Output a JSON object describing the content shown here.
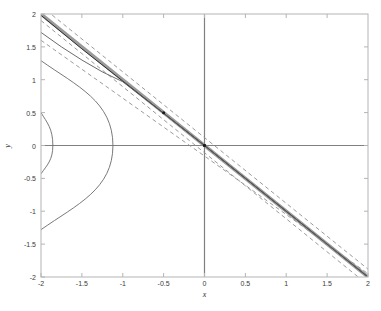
{
  "figure": {
    "background_color": "#ffffff",
    "width": 381,
    "height": 311
  },
  "chart_data": {
    "type": "line",
    "title": "",
    "subtitle": "",
    "xlabel": "x",
    "ylabel": "y",
    "xlim": [
      -2,
      2
    ],
    "ylim": [
      -2,
      2
    ],
    "grid": false,
    "legend": null,
    "legend_position": "none",
    "box": true,
    "tick_direction": "in",
    "xticks": [
      -2,
      -1.5,
      -1,
      -0.5,
      0,
      0.5,
      1,
      1.5,
      2
    ],
    "xtick_labels": [
      "-2",
      "-1.5",
      "-1",
      "-0.5",
      "0",
      "0.5",
      "1",
      "1.5",
      "2"
    ],
    "yticks": [
      -2,
      -1.5,
      -1,
      -0.5,
      0,
      0.5,
      1,
      1.5,
      2
    ],
    "ytick_labels": [
      "-2",
      "-1.5",
      "-1",
      "-0.5",
      "0",
      "0.5",
      "1",
      "1.5",
      "2"
    ],
    "reference_lines": [
      {
        "name": "x-axis-zero-line",
        "orientation": "horizontal",
        "value": 0,
        "color": "#808080",
        "style": "solid",
        "width": 1.2
      },
      {
        "name": "y-axis-zero-line",
        "orientation": "vertical",
        "value": 0,
        "color": "#808080",
        "style": "solid",
        "width": 1.2
      }
    ],
    "series": [
      {
        "name": "thick-gray-band",
        "label": "",
        "type": "line",
        "style": "solid",
        "color": "#9a9a9a",
        "width": 3.4,
        "points": [
          [
            -2,
            2
          ],
          [
            2,
            -2
          ]
        ]
      },
      {
        "name": "dark-center-line",
        "label": "",
        "type": "line",
        "style": "solid",
        "color": "#303030",
        "width": 1.0,
        "points": [
          [
            -2,
            1.98
          ],
          [
            -1.5,
            1.47
          ],
          [
            -1.0,
            0.98
          ],
          [
            -0.5,
            0.49
          ],
          [
            0,
            0.0
          ],
          [
            0.5,
            -0.5
          ],
          [
            1.0,
            -1.0
          ],
          [
            1.5,
            -1.5
          ],
          [
            2,
            -2.0
          ]
        ]
      },
      {
        "name": "dashed-upper-bound",
        "label": "",
        "type": "line",
        "style": "dashed",
        "color": "#8e8e8e",
        "width": 0.9,
        "points": [
          [
            -2,
            1.9
          ],
          [
            2,
            -2.12
          ]
        ]
      },
      {
        "name": "dashed-lower-bound",
        "label": "",
        "type": "line",
        "style": "dashed",
        "color": "#8e8e8e",
        "width": 0.9,
        "points": [
          [
            -2,
            2.12
          ],
          [
            2,
            -1.88
          ]
        ]
      },
      {
        "name": "dashed-inner-bound",
        "label": "",
        "type": "line",
        "style": "dashed",
        "color": "#8e8e8e",
        "width": 0.9,
        "points": [
          [
            -2,
            1.6
          ],
          [
            -1.0,
            0.72
          ],
          [
            0,
            -0.16
          ],
          [
            1.0,
            -1.05
          ],
          [
            2,
            -1.95
          ]
        ]
      },
      {
        "name": "thin-solid-curve",
        "label": "",
        "type": "line",
        "style": "solid",
        "color": "#5a5a5a",
        "width": 0.9,
        "points": [
          [
            -2,
            1.72
          ],
          [
            -1.75,
            1.5
          ],
          [
            -1.5,
            1.3
          ],
          [
            -1.25,
            1.12
          ],
          [
            -1.0,
            0.97
          ],
          [
            -0.75,
            0.73
          ],
          [
            -0.5,
            0.49
          ],
          [
            0,
            0.0
          ],
          [
            0.5,
            -0.5
          ],
          [
            1.0,
            -1.0
          ],
          [
            1.5,
            -1.5
          ],
          [
            2,
            -2.0
          ]
        ]
      },
      {
        "name": "outer-left-opening-arc",
        "label": "",
        "type": "line",
        "style": "solid",
        "color": "#6a6a6a",
        "width": 0.9,
        "description": "left-opening conic, vertex near (-1.12, 0), exits left edge at y = +/-1.29",
        "vertex": [
          -1.12,
          0
        ],
        "edge_crossings": [
          [
            -2,
            1.29
          ],
          [
            -2,
            -1.28
          ]
        ],
        "points": [
          [
            -2,
            1.29
          ],
          [
            -1.85,
            1.17
          ],
          [
            -1.7,
            1.05
          ],
          [
            -1.55,
            0.93
          ],
          [
            -1.4,
            0.79
          ],
          [
            -1.3,
            0.67
          ],
          [
            -1.2,
            0.5
          ],
          [
            -1.14,
            0.3
          ],
          [
            -1.12,
            0
          ],
          [
            -1.14,
            -0.3
          ],
          [
            -1.2,
            -0.5
          ],
          [
            -1.3,
            -0.67
          ],
          [
            -1.4,
            -0.79
          ],
          [
            -1.55,
            -0.93
          ],
          [
            -1.7,
            -1.04
          ],
          [
            -1.85,
            -1.16
          ],
          [
            -2,
            -1.28
          ]
        ]
      },
      {
        "name": "inner-left-opening-arc",
        "label": "",
        "type": "line",
        "style": "solid",
        "color": "#6a6a6a",
        "width": 0.9,
        "description": "small left-opening conic, vertex near (-1.855, 0), exits left edge at y = 0.5 and y = -0.43",
        "vertex": [
          -1.855,
          0
        ],
        "edge_crossings": [
          [
            -2,
            0.5
          ],
          [
            -2,
            -0.43
          ]
        ],
        "points": [
          [
            -2,
            0.5
          ],
          [
            -1.97,
            0.42
          ],
          [
            -1.94,
            0.34
          ],
          [
            -1.91,
            0.26
          ],
          [
            -1.885,
            0.17
          ],
          [
            -1.868,
            0.09
          ],
          [
            -1.858,
            0.0
          ],
          [
            -1.866,
            -0.08
          ],
          [
            -1.885,
            -0.15
          ],
          [
            -1.915,
            -0.24
          ],
          [
            -1.95,
            -0.33
          ],
          [
            -1.98,
            -0.4
          ],
          [
            -2,
            -0.43
          ]
        ]
      }
    ],
    "markers": [
      {
        "name": "marker-origin",
        "x": 0,
        "y": 0,
        "color": "#1a1a1a",
        "size": 3.4,
        "shape": "circle"
      },
      {
        "name": "marker-midpoint",
        "x": -0.5,
        "y": 0.5,
        "color": "#1a1a1a",
        "size": 3.0,
        "shape": "circle"
      }
    ],
    "colors": {
      "band": "#9a9a9a",
      "dark_line": "#303030",
      "dashed": "#8e8e8e",
      "curve": "#6a6a6a",
      "axis_box": "#b4b4b4",
      "zero_line": "#808080",
      "tick_text": "#3a3a3a",
      "label_text": "#2e2e2e"
    }
  }
}
